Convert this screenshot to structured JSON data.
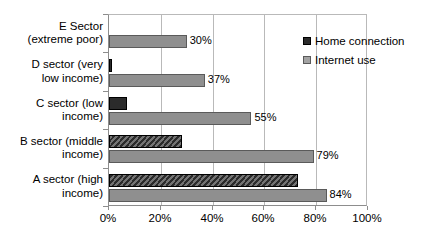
{
  "chart_data": {
    "type": "bar",
    "orientation": "horizontal",
    "title": "",
    "xlabel": "",
    "ylabel": "",
    "xlim": [
      0,
      100
    ],
    "grid": true,
    "legend_position": "top-right",
    "xticks": [
      "0%",
      "20%",
      "40%",
      "60%",
      "80%",
      "100%"
    ],
    "xtick_values": [
      0,
      20,
      40,
      60,
      80,
      100
    ],
    "categories": [
      "A sector (high income)",
      "B sector (middle income)",
      "C sector (low income)",
      "D sector (very low income)",
      "E Sector (extreme poor)"
    ],
    "category_lines": [
      [
        "A sector (high",
        "income)"
      ],
      [
        "B sector (middle",
        "income)"
      ],
      [
        "C sector (low",
        "income)"
      ],
      [
        "D sector (very",
        "low income)"
      ],
      [
        "E Sector",
        "(extreme poor)"
      ]
    ],
    "series": [
      {
        "name": "Home connection",
        "color": "#2b2b2b",
        "values": [
          73,
          28,
          7,
          1,
          0
        ],
        "labels": [
          "",
          "",
          "",
          "",
          ""
        ]
      },
      {
        "name": "Internet use",
        "color": "#8f8f8f",
        "values": [
          84,
          79,
          55,
          37,
          30
        ],
        "labels": [
          "84%",
          "79%",
          "55%",
          "37%",
          "30%"
        ]
      }
    ]
  },
  "legend": {
    "items": [
      {
        "label": "Home connection",
        "swatch": "dark"
      },
      {
        "label": "Internet use",
        "swatch": "gray"
      }
    ]
  }
}
